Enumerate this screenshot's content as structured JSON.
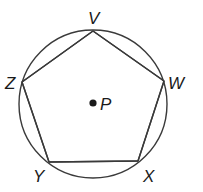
{
  "figure": {
    "circle": {
      "center_label": "P"
    },
    "polygon": {
      "name": "VWXYZ",
      "vertices": [
        {
          "id": "V",
          "label": "V"
        },
        {
          "id": "W",
          "label": "W"
        },
        {
          "id": "X",
          "label": "X"
        },
        {
          "id": "Y",
          "label": "Y"
        },
        {
          "id": "Z",
          "label": "Z"
        }
      ]
    },
    "colors": {
      "stroke": "#3a3a3a",
      "text": "#1a1a1a",
      "background": "#ffffff"
    }
  }
}
